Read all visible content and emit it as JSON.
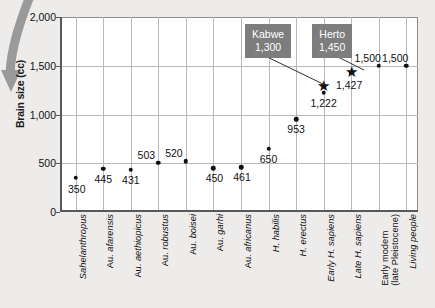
{
  "chart_data": {
    "type": "scatter",
    "title": "",
    "xlabel": "",
    "ylabel": "Brain size (cc)",
    "ylim": [
      0,
      2000
    ],
    "yticks": [
      0,
      500,
      1000,
      1500,
      2000
    ],
    "ytick_labels": [
      "0",
      "500",
      "1,000",
      "1,500",
      "2,000"
    ],
    "grid": true,
    "legend": "none",
    "categories": [
      "Sahelanthropus",
      "Au. afarensis",
      "Au. aethiopicus",
      "Au. robustus",
      "Au. boisei",
      "Au. garhi",
      "Au. africanus",
      "H. habilis",
      "H. erectus",
      "Early H. sapiens",
      "Late H. sapiens",
      "Early modern (late Pleistocene)",
      "Living people"
    ],
    "values": [
      350,
      445,
      431,
      503,
      520,
      450,
      461,
      650,
      953,
      1222,
      1427,
      1500,
      1500
    ],
    "point_labels": [
      "350",
      "445",
      "431",
      "503",
      "520",
      "450",
      "461",
      "650",
      "953",
      "1,222",
      "1,427",
      "1,500",
      "1,500"
    ],
    "star_markers": [
      {
        "category": "Early H. sapiens",
        "value": 1300,
        "name": "Kabwe",
        "label": "1,300"
      },
      {
        "category": "Late H. sapiens",
        "value": 1450,
        "name": "Herto",
        "label": "1,450"
      }
    ]
  },
  "axis": {
    "y_title": "Brain size (cc)",
    "y_tick_labels": [
      "2,000",
      "1,500",
      "1,000",
      "500",
      "0"
    ]
  },
  "points": [
    {
      "label": "350",
      "cat": "Sahelanthropus"
    },
    {
      "label": "445",
      "cat": "Au. afarensis"
    },
    {
      "label": "431",
      "cat": "Au. aethiopicus"
    },
    {
      "label": "503",
      "cat": "Au. robustus"
    },
    {
      "label": "520",
      "cat": "Au. boisei"
    },
    {
      "label": "450",
      "cat": "Au. garhi"
    },
    {
      "label": "461",
      "cat": "Au. africanus"
    },
    {
      "label": "650",
      "cat": "H. habilis"
    },
    {
      "label": "953",
      "cat": "H. erectus"
    },
    {
      "label": "1,222",
      "cat": "Early H. sapiens"
    },
    {
      "label": "1,427",
      "cat": "Late H. sapiens"
    },
    {
      "label": "1,500",
      "cat": "Early modern (late Pleistocene)"
    },
    {
      "label": "1,500",
      "cat": "Living people"
    }
  ],
  "callouts": [
    {
      "name": "Kabwe",
      "value": "1,300"
    },
    {
      "name": "Herto",
      "value": "1,450"
    }
  ],
  "xlabels": [
    {
      "main": "Sahelanthropus",
      "prefix": "",
      "line2": ""
    },
    {
      "main": "afarensis",
      "prefix": "Au. ",
      "line2": ""
    },
    {
      "main": "aethiopicus",
      "prefix": "Au. ",
      "line2": ""
    },
    {
      "main": "robustus",
      "prefix": "Au. ",
      "line2": ""
    },
    {
      "main": "boisei",
      "prefix": "Au. ",
      "line2": ""
    },
    {
      "main": "garhi",
      "prefix": "Au. ",
      "line2": ""
    },
    {
      "main": "africanus",
      "prefix": "Au. ",
      "line2": ""
    },
    {
      "main": "H. habilis",
      "prefix": "",
      "line2": ""
    },
    {
      "main": "H. erectus",
      "prefix": "",
      "line2": ""
    },
    {
      "main": "Early H. sapiens",
      "prefix": "",
      "line2": ""
    },
    {
      "main": "Late H. sapiens",
      "prefix": "",
      "line2": ""
    },
    {
      "main": "Early modern",
      "prefix": "",
      "line2": "(late Pleistocene)"
    },
    {
      "main": "Living people",
      "prefix": "",
      "line2": ""
    }
  ],
  "colors": {
    "background": "#eeecea",
    "plot_background": "#ffffff",
    "axis": "#595959",
    "gridline": "#b9b9b9",
    "point": "#111111",
    "callout_bg": "#7d7d7d",
    "callout_text": "#ffffff",
    "arrow": "#9a9a9a"
  }
}
